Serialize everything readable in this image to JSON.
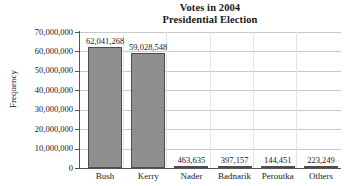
{
  "chart_data": {
    "type": "bar",
    "title": "Votes in 2004 Presidential Election",
    "title_lines": [
      "Votes in 2004",
      "Presidential Election"
    ],
    "xlabel": "",
    "ylabel": "Frequency",
    "categories": [
      "Bush",
      "Kerry",
      "Nader",
      "Badnarik",
      "Peroutka",
      "Others"
    ],
    "values": [
      62041268,
      59028548,
      463635,
      397157,
      144451,
      223249
    ],
    "value_labels": [
      "62,041,268",
      "59,028,548",
      "463,635",
      "397,157",
      "144,451",
      "223,249"
    ],
    "ylim": [
      0,
      70000000
    ],
    "ytick_values": [
      0,
      10000000,
      20000000,
      30000000,
      40000000,
      50000000,
      60000000,
      70000000
    ],
    "ytick_labels": [
      "0",
      "10,000,000",
      "20,000,000",
      "30,000,000",
      "40,000,000",
      "50,000,000",
      "60,000,000",
      "70,000,000"
    ],
    "grid": true,
    "legend": false,
    "bar_color": "#8f8f8f",
    "bar_border_color": "#4d4d4d",
    "gridline_color": "#c9c9c9",
    "axis_color": "#555555",
    "background_color": "#ffffff"
  }
}
